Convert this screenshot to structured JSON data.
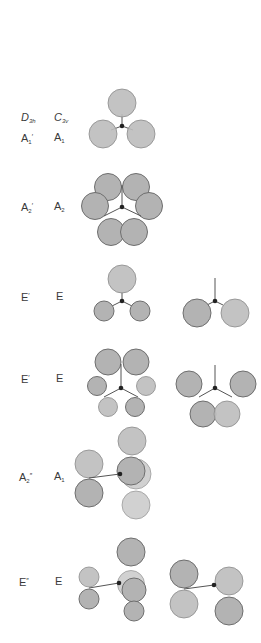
{
  "header": {
    "col1": {
      "main": "D",
      "sub": "3h"
    },
    "col2": {
      "main": "C",
      "sub": "3v"
    }
  },
  "rows": [
    {
      "d3h": {
        "main": "A",
        "sub": "1",
        "prime": "′"
      },
      "c3v": {
        "main": "A",
        "sub": "1",
        "prime": ""
      }
    },
    {
      "d3h": {
        "main": "A",
        "sub": "2",
        "prime": "′"
      },
      "c3v": {
        "main": "A",
        "sub": "2",
        "prime": ""
      }
    },
    {
      "d3h": {
        "main": "E",
        "sub": "",
        "prime": "′"
      },
      "c3v": {
        "main": "E",
        "sub": "",
        "prime": ""
      }
    },
    {
      "d3h": {
        "main": "E",
        "sub": "",
        "prime": "′"
      },
      "c3v": {
        "main": "E",
        "sub": "",
        "prime": ""
      }
    },
    {
      "d3h": {
        "main": "A",
        "sub": "2",
        "prime": "″"
      },
      "c3v": {
        "main": "A",
        "sub": "1",
        "prime": ""
      }
    },
    {
      "d3h": {
        "main": "E",
        "sub": "",
        "prime": "″"
      },
      "c3v": {
        "main": "E",
        "sub": "",
        "prime": ""
      }
    }
  ],
  "colors": {
    "lobe_fill": "#b3b3b3",
    "lobe_stroke": "#6e6e6e",
    "bond": "#555555",
    "atom": "#222222",
    "text": "#3a3a3a"
  }
}
